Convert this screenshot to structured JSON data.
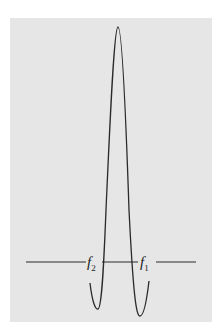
{
  "diagram": {
    "background_color": "#e6e6e6",
    "line_color": "#2a2a2a",
    "labels": [
      {
        "name": "f",
        "subscript": "2"
      },
      {
        "name": "f",
        "subscript": "1"
      }
    ]
  }
}
